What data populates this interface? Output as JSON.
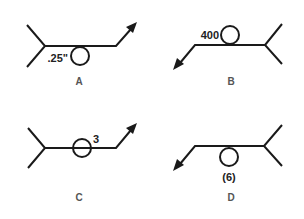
{
  "figure": {
    "symbols": [
      {
        "id": "A",
        "label": "A",
        "note": ".25\"",
        "circle_side": "below",
        "arrow_direction": "up-right"
      },
      {
        "id": "B",
        "label": "B",
        "note": "400",
        "circle_side": "above",
        "arrow_direction": "down-left"
      },
      {
        "id": "C",
        "label": "C",
        "note": "3",
        "circle_side": "on-line",
        "arrow_direction": "up-right"
      },
      {
        "id": "D",
        "label": "D",
        "note": "(6)",
        "circle_side": "below",
        "arrow_direction": "down-left"
      }
    ]
  },
  "colors": {
    "ink": "#1a1a1a",
    "label": "#555555",
    "background": "#ffffff"
  }
}
